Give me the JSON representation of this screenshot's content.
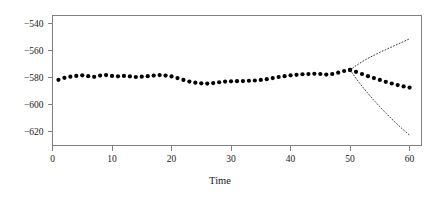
{
  "chart_data": {
    "type": "line",
    "title": "",
    "xlabel": "Time",
    "ylabel": "",
    "xlim": [
      0,
      62
    ],
    "ylim": [
      -630,
      -534
    ],
    "grid": false,
    "legend": "none",
    "xticks": [
      0,
      10,
      20,
      30,
      40,
      50,
      60
    ],
    "xtick_labels": [
      "0",
      "10",
      "20",
      "30",
      "40",
      "50",
      "60"
    ],
    "yticks": [
      -540,
      -560,
      -580,
      -600,
      -620
    ],
    "ytick_labels": [
      "−540",
      "−560",
      "−580",
      "−600",
      "−620"
    ],
    "series": [
      {
        "name": "observed",
        "style": "points-filled-circle",
        "x": [
          1,
          2,
          3,
          4,
          5,
          6,
          7,
          8,
          9,
          10,
          11,
          12,
          13,
          14,
          15,
          16,
          17,
          18,
          19,
          20,
          21,
          22,
          23,
          24,
          25,
          26,
          27,
          28,
          29,
          30,
          31,
          32,
          33,
          34,
          35,
          36,
          37,
          38,
          39,
          40,
          41,
          42,
          43,
          44,
          45,
          46,
          47,
          48,
          49,
          50
        ],
        "values": [
          -581.5,
          -580.0,
          -579.2,
          -578.6,
          -578.2,
          -578.8,
          -579.3,
          -578.4,
          -578.0,
          -578.6,
          -578.9,
          -578.6,
          -579.0,
          -579.4,
          -579.2,
          -578.8,
          -578.4,
          -578.0,
          -578.4,
          -579.0,
          -580.2,
          -581.6,
          -582.8,
          -583.6,
          -584.1,
          -584.3,
          -583.9,
          -583.3,
          -582.8,
          -582.6,
          -582.5,
          -582.4,
          -582.2,
          -582.0,
          -581.6,
          -581.0,
          -580.2,
          -579.4,
          -578.8,
          -578.2,
          -577.8,
          -577.4,
          -577.2,
          -577.0,
          -577.2,
          -577.6,
          -577.2,
          -576.2,
          -575.0,
          -574.2
        ]
      },
      {
        "name": "forecast",
        "style": "points-filled-circle",
        "x": [
          50,
          51,
          52,
          53,
          54,
          55,
          56,
          57,
          58,
          59,
          60
        ],
        "values": [
          -574.2,
          -575.6,
          -577.2,
          -578.8,
          -580.2,
          -581.6,
          -583.0,
          -584.2,
          -585.4,
          -586.4,
          -587.2
        ]
      },
      {
        "name": "upper-prediction-interval",
        "style": "dotted-line",
        "x": [
          50,
          51,
          52,
          53,
          54,
          55,
          56,
          57,
          58,
          59,
          60
        ],
        "values": [
          -574.2,
          -571.0,
          -568.2,
          -565.6,
          -563.4,
          -561.2,
          -559.2,
          -557.2,
          -555.2,
          -553.2,
          -551.2
        ]
      },
      {
        "name": "lower-prediction-interval",
        "style": "dotted-line",
        "x": [
          50,
          51,
          52,
          53,
          54,
          55,
          56,
          57,
          58,
          59,
          60
        ],
        "values": [
          -574.2,
          -580.4,
          -586.2,
          -591.6,
          -596.6,
          -601.4,
          -606.0,
          -610.4,
          -614.6,
          -618.6,
          -622.4
        ]
      }
    ]
  }
}
